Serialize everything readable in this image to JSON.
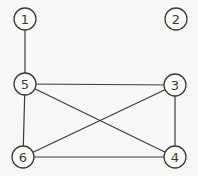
{
  "diagram": {
    "type": "undirected-graph",
    "colors": {
      "background": "#f7f7f5",
      "stroke": "#3c3c3c",
      "label": "#3a3a3a"
    },
    "nodes": [
      {
        "id": "1",
        "label": "1",
        "x": 25,
        "y": 19
      },
      {
        "id": "2",
        "label": "2",
        "x": 176,
        "y": 19
      },
      {
        "id": "3",
        "label": "3",
        "x": 175,
        "y": 85
      },
      {
        "id": "4",
        "label": "4",
        "x": 175,
        "y": 157
      },
      {
        "id": "5",
        "label": "5",
        "x": 25,
        "y": 84
      },
      {
        "id": "6",
        "label": "6",
        "x": 23,
        "y": 157
      }
    ],
    "node_radius": 11,
    "edges": [
      {
        "from": "1",
        "to": "5"
      },
      {
        "from": "5",
        "to": "3"
      },
      {
        "from": "5",
        "to": "6"
      },
      {
        "from": "5",
        "to": "4"
      },
      {
        "from": "3",
        "to": "6"
      },
      {
        "from": "3",
        "to": "4"
      },
      {
        "from": "6",
        "to": "4"
      }
    ]
  }
}
